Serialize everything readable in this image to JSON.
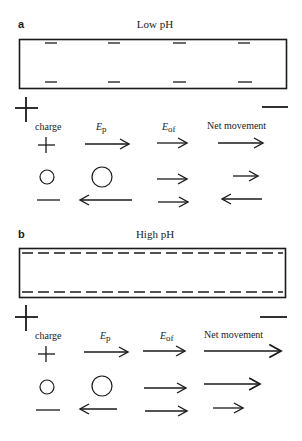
{
  "panels": [
    {
      "letter": "a",
      "title": "Low pH",
      "surface_charge": "sparse negative charges",
      "electrodes": {
        "left": "+",
        "right": "−"
      },
      "headers": {
        "charge": "charge",
        "ep_main": "E",
        "ep_sub": "p",
        "eof_main": "E",
        "eof_sub": "of",
        "net": "Net movement"
      },
      "rows": [
        {
          "charge": "positive",
          "ep": {
            "dir": "right",
            "length": 44
          },
          "eof": {
            "dir": "right",
            "length": 30
          },
          "net": {
            "dir": "right",
            "length": 45
          }
        },
        {
          "charge": "neutral",
          "ep": {
            "dir": "none",
            "length": 0
          },
          "eof": {
            "dir": "right",
            "length": 30
          },
          "net": {
            "dir": "right",
            "length": 25
          }
        },
        {
          "charge": "negative",
          "ep": {
            "dir": "left",
            "length": 52
          },
          "eof": {
            "dir": "right",
            "length": 30
          },
          "net": {
            "dir": "left",
            "length": 40
          }
        }
      ]
    },
    {
      "letter": "b",
      "title": "High pH",
      "surface_charge": "dense negative charges",
      "electrodes": {
        "left": "+",
        "right": "−"
      },
      "headers": {
        "charge": "charge",
        "ep_main": "E",
        "ep_sub": "p",
        "eof_main": "E",
        "eof_sub": "of",
        "net": "Net movement"
      },
      "rows": [
        {
          "charge": "positive",
          "ep": {
            "dir": "right",
            "length": 44
          },
          "eof": {
            "dir": "right",
            "length": 42
          },
          "net": {
            "dir": "right",
            "length": 77
          }
        },
        {
          "charge": "neutral",
          "ep": {
            "dir": "none",
            "length": 0
          },
          "eof": {
            "dir": "right",
            "length": 42
          },
          "net": {
            "dir": "right",
            "length": 56
          }
        },
        {
          "charge": "negative",
          "ep": {
            "dir": "left",
            "length": 37
          },
          "eof": {
            "dir": "right",
            "length": 42
          },
          "net": {
            "dir": "right",
            "length": 30
          }
        }
      ]
    }
  ]
}
